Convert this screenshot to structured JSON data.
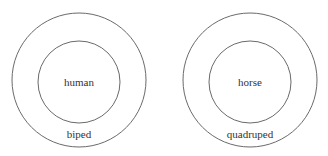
{
  "diagram": {
    "type": "nested-circles",
    "groups": [
      {
        "outer_label": "biped",
        "inner_label": "human"
      },
      {
        "outer_label": "quadruped",
        "inner_label": "horse"
      }
    ]
  }
}
